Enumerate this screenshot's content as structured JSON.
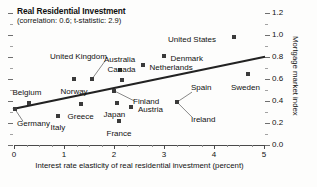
{
  "chart_data": {
    "type": "scatter",
    "title": "Real Residential Investment",
    "subtitle": "(correlation: 0.6; t-statistic: 2.9)",
    "xlabel": "Interest rate elasticity of real residential investment (percent)",
    "ylabel": "Mortgage market index",
    "xlim": [
      0,
      5
    ],
    "ylim": [
      0.0,
      1.2
    ],
    "xticks": [
      "0",
      "1",
      "2",
      "3",
      "4",
      "5"
    ],
    "xtick_values": [
      0,
      1,
      2,
      3,
      4,
      5
    ],
    "x_minor_step": 0.25,
    "yticks": [
      "0.0",
      "0.2",
      "0.4",
      "0.6",
      "0.8",
      "1.0",
      "1.2"
    ],
    "ytick_values": [
      0.0,
      0.2,
      0.4,
      0.6,
      0.8,
      1.0,
      1.2
    ],
    "y_minor_step": 0.1,
    "grid": false,
    "legend": "none",
    "correlation": 0.6,
    "t_statistic": 2.9,
    "points": [
      {
        "label": "Germany",
        "x": 0.02,
        "y": 0.325,
        "label_dx": 2,
        "label_dy": 15,
        "leader": true
      },
      {
        "label": "Belgium",
        "x": 0.3,
        "y": 0.385,
        "label_dx": -1,
        "label_dy": -10,
        "leader": false
      },
      {
        "label": "Italy",
        "x": 0.88,
        "y": 0.265,
        "label_dx": 0,
        "label_dy": 12,
        "leader": false
      },
      {
        "label": "Norway",
        "x": 1.2,
        "y": 0.6,
        "label_dx": 0,
        "label_dy": 13,
        "leader": false
      },
      {
        "label": "Greece",
        "x": 1.33,
        "y": 0.375,
        "label_dx": 0,
        "label_dy": 13,
        "leader": false
      },
      {
        "label": "United Kingdom",
        "x": 1.56,
        "y": 0.6,
        "label_dx": -42,
        "label_dy": -22,
        "leader": true
      },
      {
        "label": "Japan",
        "x": 2.05,
        "y": 0.38,
        "label_dx": -2,
        "label_dy": 12,
        "leader": false
      },
      {
        "label": "France",
        "x": 2.1,
        "y": 0.222,
        "label_dx": 0,
        "label_dy": 13,
        "leader": false
      },
      {
        "label": "Australia",
        "x": 2.11,
        "y": 0.68,
        "label_dx": 0,
        "label_dy": -10,
        "leader": false
      },
      {
        "label": "Canada",
        "x": 2.15,
        "y": 0.59,
        "label_dx": 0,
        "label_dy": -10,
        "leader": false
      },
      {
        "label": "Finland",
        "x": 2.0,
        "y": 0.493,
        "label_dx": 19,
        "label_dy": 11,
        "leader": true
      },
      {
        "label": "Austria",
        "x": 2.34,
        "y": 0.345,
        "label_dx": 7,
        "label_dy": 3,
        "leader": false
      },
      {
        "label": "Netherlands",
        "x": 2.57,
        "y": 0.725,
        "label_dx": 7,
        "label_dy": 3,
        "leader": false
      },
      {
        "label": "Denmark",
        "x": 2.99,
        "y": 0.81,
        "label_dx": 7,
        "label_dy": 3,
        "leader": false
      },
      {
        "label": "Spain",
        "x": 3.26,
        "y": 0.39,
        "label_dx": 14,
        "label_dy": -14,
        "leader": true
      },
      {
        "label": "Ireland",
        "x": 3.26,
        "y": 0.39,
        "label_dx": 14,
        "label_dy": 18,
        "leader": true
      },
      {
        "label": "United States",
        "x": 4.4,
        "y": 0.978,
        "label_dx": -66,
        "label_dy": 3,
        "leader": false
      },
      {
        "label": "Sweden",
        "x": 4.67,
        "y": 0.65,
        "label_dx": -2,
        "label_dy": 14,
        "leader": false
      }
    ],
    "trendline": {
      "x0": 0.0,
      "y0": 0.33,
      "x1": 5.0,
      "y1": 0.8
    }
  }
}
